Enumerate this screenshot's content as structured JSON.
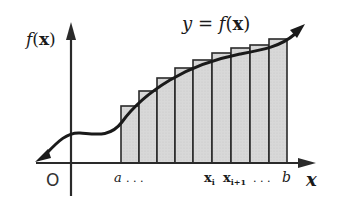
{
  "diagram": {
    "curve_label": "y = f(x)",
    "y_axis_label": "f(x)",
    "x_axis_label": "x",
    "origin_label": "O",
    "x_ticks": {
      "a": "a",
      "dots_left": ". . .",
      "xi": "x",
      "xi_sub": "i",
      "xi1": "x",
      "xi1_sub": "i+1",
      "dots_right": ". . .",
      "b": "b"
    },
    "colors": {
      "axis": "#2a2a2a",
      "curve": "#1a1a1a",
      "rect_fill": "#d6d6d6",
      "rect_stroke": "#2a2a2a",
      "background": "#ffffff"
    },
    "rectangles": [
      {
        "x": 121,
        "top": 106
      },
      {
        "x": 139,
        "top": 91
      },
      {
        "x": 157,
        "top": 78
      },
      {
        "x": 175,
        "top": 68
      },
      {
        "x": 193,
        "top": 60
      },
      {
        "x": 212,
        "top": 53
      },
      {
        "x": 231,
        "top": 48
      },
      {
        "x": 250,
        "top": 45
      },
      {
        "x": 269,
        "top": 39
      }
    ],
    "rect_width": 18,
    "baseline_y": 163
  }
}
